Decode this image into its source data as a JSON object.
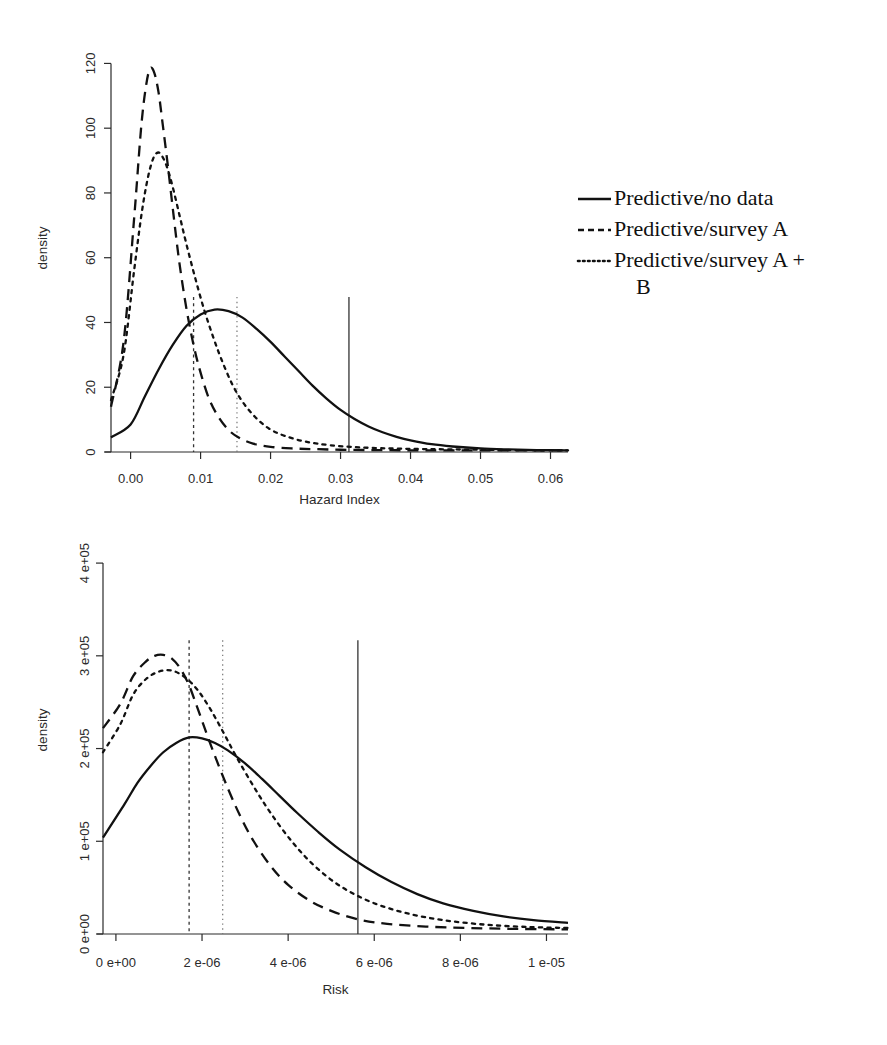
{
  "figure": {
    "background_color": "#ffffff",
    "line_color": "#111111",
    "panels": [
      "hazard-index-density",
      "risk-density"
    ]
  },
  "legend": {
    "entries": [
      {
        "label": "Predictive/no data",
        "style": "solid"
      },
      {
        "label": "Predictive/survey A",
        "style": "dashed"
      },
      {
        "label": "Predictive/survey A +",
        "label_wrap": "B",
        "style": "dotted"
      }
    ]
  },
  "chart_data": [
    {
      "id": "hazard-index-density",
      "type": "line",
      "title": "",
      "xlabel": "Hazard Index",
      "ylabel": "density",
      "xlim": [
        -0.0028,
        0.0625
      ],
      "ylim": [
        0,
        126
      ],
      "xticks": [
        0.0,
        0.01,
        0.02,
        0.03,
        0.04,
        0.05,
        0.06
      ],
      "xticklabels": [
        "0.00",
        "0.01",
        "0.02",
        "0.03",
        "0.04",
        "0.05",
        "0.06"
      ],
      "yticks": [
        0,
        20,
        40,
        60,
        80,
        100,
        120
      ],
      "yticklabels": [
        "0",
        "20",
        "40",
        "60",
        "80",
        "100",
        "120"
      ],
      "grid": false,
      "legend_position": "right",
      "series": [
        {
          "name": "Predictive/no data",
          "style": "solid",
          "x": [
            -0.0028,
            0.0,
            0.002,
            0.004,
            0.006,
            0.008,
            0.01,
            0.012,
            0.014,
            0.016,
            0.018,
            0.02,
            0.022,
            0.024,
            0.026,
            0.028,
            0.03,
            0.032,
            0.034,
            0.036,
            0.038,
            0.04,
            0.043,
            0.046,
            0.05,
            0.054,
            0.058,
            0.0625
          ],
          "y": [
            4.5,
            8.5,
            17.0,
            25.5,
            33.0,
            39.0,
            42.5,
            44.0,
            43.5,
            41.5,
            38.0,
            34.0,
            29.5,
            25.0,
            20.5,
            16.5,
            13.0,
            10.2,
            7.9,
            6.1,
            4.7,
            3.6,
            2.4,
            1.7,
            1.1,
            0.8,
            0.6,
            0.5
          ]
        },
        {
          "name": "Predictive/survey A",
          "style": "dashed",
          "x": [
            -0.0028,
            -0.001,
            0.0005,
            0.0015,
            0.0022,
            0.0028,
            0.0034,
            0.004,
            0.0046,
            0.0054,
            0.0062,
            0.007,
            0.008,
            0.009,
            0.01,
            0.0112,
            0.0125,
            0.014,
            0.0155,
            0.0175,
            0.02,
            0.023,
            0.026,
            0.03,
            0.035,
            0.042,
            0.05,
            0.058,
            0.0625
          ],
          "y": [
            14.0,
            34.0,
            72.0,
            100.0,
            113.0,
            118.5,
            117.0,
            111.0,
            101.0,
            87.0,
            72.0,
            58.0,
            44.0,
            33.0,
            24.5,
            16.5,
            11.0,
            6.8,
            4.4,
            2.6,
            1.6,
            1.1,
            0.9,
            0.7,
            0.6,
            0.5,
            0.5,
            0.5,
            0.5
          ]
        },
        {
          "name": "Predictive/survey A + B",
          "style": "dotted",
          "x": [
            -0.0028,
            -0.001,
            0.0005,
            0.0016,
            0.0025,
            0.0033,
            0.004,
            0.0046,
            0.0052,
            0.006,
            0.007,
            0.008,
            0.0092,
            0.0105,
            0.0118,
            0.013,
            0.0145,
            0.016,
            0.0178,
            0.0198,
            0.022,
            0.025,
            0.0285,
            0.033,
            0.039,
            0.046,
            0.054,
            0.0625
          ],
          "y": [
            16.0,
            30.0,
            56.0,
            74.0,
            85.0,
            91.0,
            92.5,
            91.0,
            88.0,
            82.0,
            73.0,
            64.0,
            54.0,
            44.0,
            35.5,
            28.5,
            21.0,
            15.5,
            10.8,
            7.2,
            5.0,
            3.2,
            2.1,
            1.4,
            1.0,
            0.8,
            0.6,
            0.5
          ]
        }
      ],
      "vlines": [
        {
          "x": 0.009,
          "style": "dashed",
          "label": "survey A reference"
        },
        {
          "x": 0.0152,
          "style": "dotted",
          "label": "survey A + B reference"
        },
        {
          "x": 0.0312,
          "style": "solid",
          "label": "no data reference"
        }
      ]
    },
    {
      "id": "risk-density",
      "type": "line",
      "title": "",
      "xlabel": "Risk",
      "ylabel": "density",
      "xlim": [
        -3e-07,
        1.05e-05
      ],
      "ylim": [
        0,
        440000
      ],
      "xticks": [
        0.0,
        2e-06,
        4e-06,
        6e-06,
        8e-06,
        1e-05
      ],
      "xticklabels": [
        "0  e+00",
        "2  e-06",
        "4  e-06",
        "6  e-06",
        "8  e-06",
        "1  e-05"
      ],
      "yticks": [
        0,
        100000,
        200000,
        300000,
        400000
      ],
      "yticklabels": [
        "0  e+00",
        "1  e+05",
        "2  e+05",
        "3  e+05",
        "4  e+05"
      ],
      "grid": false,
      "legend_position": "none",
      "series": [
        {
          "name": "Predictive/no data",
          "style": "solid",
          "x": [
            -3e-07,
            2e-07,
            5e-07,
            8e-07,
            1.1e-06,
            1.4e-06,
            1.7e-06,
            2e-06,
            2.3e-06,
            2.6e-06,
            3e-06,
            3.4e-06,
            3.8e-06,
            4.2e-06,
            4.7e-06,
            5.2e-06,
            5.8e-06,
            6.4e-06,
            7e-06,
            7.6e-06,
            8.3e-06,
            9e-06,
            9.7e-06,
            1.05e-05
          ],
          "y": [
            104000,
            140000,
            163000,
            181000,
            196000,
            206000,
            212000,
            211000,
            206000,
            198000,
            184000,
            167000,
            149000,
            131000,
            110000,
            91000,
            72000,
            56000,
            43000,
            33000,
            25000,
            19000,
            15000,
            12000
          ]
        },
        {
          "name": "Predictive/survey A",
          "style": "dashed",
          "x": [
            -3e-07,
            1e-07,
            4e-07,
            7e-07,
            9e-07,
            1.1e-06,
            1.3e-06,
            1.5e-06,
            1.7e-06,
            1.9e-06,
            2.1e-06,
            2.3e-06,
            2.6e-06,
            2.9e-06,
            3.2e-06,
            3.6e-06,
            4e-06,
            4.5e-06,
            5e-06,
            5.6e-06,
            6.3e-06,
            7.2e-06,
            8.2e-06,
            9.3e-06,
            1.05e-05
          ],
          "y": [
            222000,
            248000,
            278000,
            294000,
            300000,
            301000,
            297000,
            286000,
            268000,
            243000,
            217000,
            192000,
            157000,
            126000,
            100000,
            73000,
            53000,
            36000,
            25000,
            16000,
            11000,
            8000,
            6500,
            5500,
            5000
          ]
        },
        {
          "name": "Predictive/survey A + B",
          "style": "dotted",
          "x": [
            -3e-07,
            1e-07,
            4e-07,
            7e-07,
            1e-06,
            1.3e-06,
            1.6e-06,
            1.9e-06,
            2.2e-06,
            2.5e-06,
            2.8e-06,
            3.2e-06,
            3.6e-06,
            4.1e-06,
            4.6e-06,
            5.2e-06,
            5.9e-06,
            6.7e-06,
            7.6e-06,
            8.6e-06,
            9.6e-06,
            1.05e-05
          ],
          "y": [
            196000,
            226000,
            258000,
            275000,
            283000,
            284000,
            277000,
            263000,
            242000,
            217000,
            191000,
            159000,
            130000,
            99000,
            74000,
            52000,
            35000,
            23000,
            15000,
            10000,
            7500,
            6500
          ]
        }
      ],
      "vlines": [
        {
          "x": 1.7e-06,
          "style": "dashed",
          "label": "survey A reference"
        },
        {
          "x": 2.48e-06,
          "style": "dotted",
          "label": "survey A + B reference"
        },
        {
          "x": 5.62e-06,
          "style": "solid",
          "label": "no data reference"
        }
      ]
    }
  ]
}
